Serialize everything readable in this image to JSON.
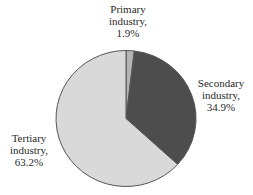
{
  "chart_data": {
    "type": "pie",
    "title": "",
    "categories": [
      "Primary industry",
      "Secondary industry",
      "Tertiary industry"
    ],
    "values": [
      1.9,
      34.9,
      63.2
    ],
    "unit": "%",
    "start_angle_deg": 0,
    "direction": "clockwise",
    "colors": [
      "#b4b4b4",
      "#4d4d4d",
      "#d9d9d9"
    ],
    "edge_color": "#555555",
    "legend": "none",
    "labels": [
      {
        "line1": "Primary",
        "line2": "industry,",
        "value": "1.9%"
      },
      {
        "line1": "Secondary",
        "line2": "industry,",
        "value": "34.9%"
      },
      {
        "line1": "Tertiary",
        "line2": "industry,",
        "value": "63.2%"
      }
    ]
  }
}
